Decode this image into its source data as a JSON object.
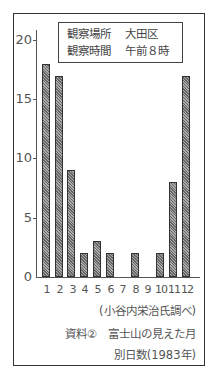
{
  "chart_data": {
    "type": "bar",
    "source": "(小谷内栄治氏調べ)",
    "legend_box": [
      {
        "key": "観察場所",
        "value": "大田区"
      },
      {
        "key": "観察時間",
        "value": "午前８時"
      }
    ],
    "categories": [
      "1",
      "2",
      "3",
      "4",
      "5",
      "6",
      "7",
      "8",
      "9",
      "10",
      "11",
      "12"
    ],
    "values": [
      18,
      17,
      9,
      2,
      3,
      2,
      0,
      2,
      0,
      2,
      8,
      17
    ],
    "xlabel": "",
    "ylabel": "",
    "yticks": [
      0,
      5,
      10,
      15,
      20
    ],
    "ylim": [
      0,
      20
    ],
    "grid": false
  },
  "legend": {
    "row1_key": "観察場所",
    "row1_val": "大田区",
    "row2_key": "観察時間",
    "row2_val": "午前８時"
  },
  "yticks": [
    "20",
    "15",
    "10",
    "5",
    "0"
  ],
  "xticks": [
    "1",
    "2",
    "3",
    "4",
    "5",
    "6",
    "7",
    "8",
    "9",
    "10",
    "11",
    "12"
  ],
  "caption": {
    "source": "(小谷内栄治氏調べ)",
    "title_line1": "資料②　富士山の見えた月",
    "title_line2": "別日数(1983年)"
  }
}
